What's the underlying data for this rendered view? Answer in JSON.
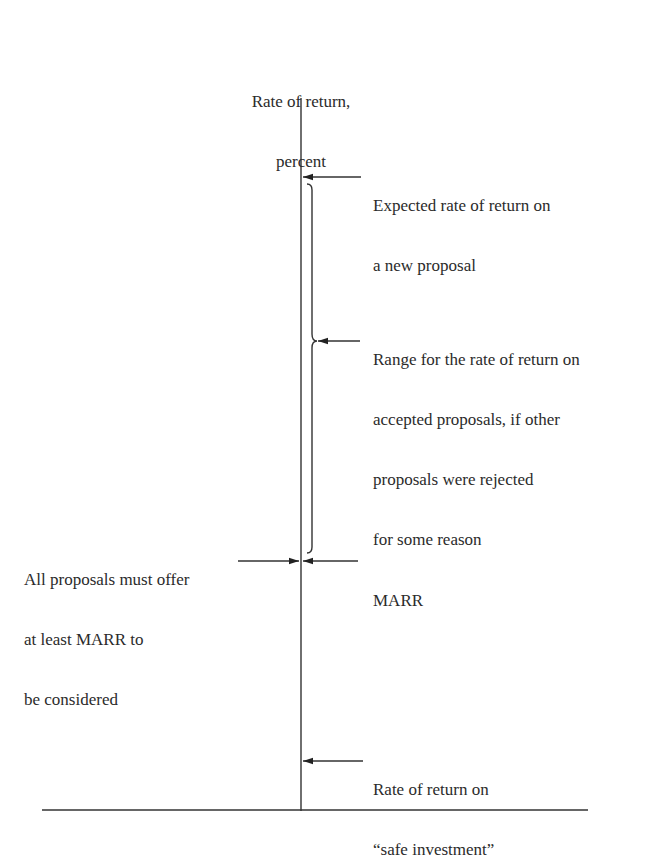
{
  "axis": {
    "label_line1": "Rate of return,",
    "label_line2": "percent"
  },
  "annotations": {
    "expected": {
      "line1": "Expected rate of return on",
      "line2": "a new proposal"
    },
    "range": {
      "line1": "Range for the rate of return on",
      "line2": "accepted proposals, if other",
      "line3": "proposals were rejected",
      "line4": "for some reason"
    },
    "all_proposals": {
      "line1": "All proposals must offer",
      "line2": "at least MARR to",
      "line3": "be considered"
    },
    "marr": {
      "label": "MARR"
    },
    "safe": {
      "line1": "Rate of return on",
      "line2": "“safe investment”"
    }
  },
  "colors": {
    "line": "#333333",
    "text": "#2b2b2b",
    "background": "#ffffff"
  }
}
